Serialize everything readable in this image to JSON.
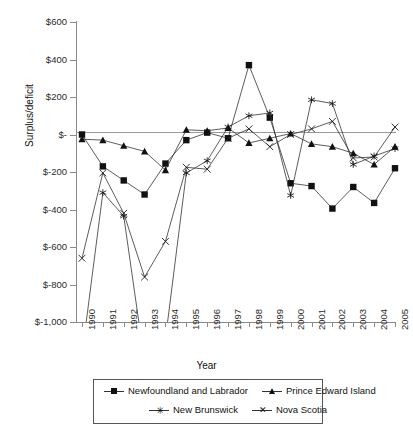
{
  "chart_data": {
    "type": "line",
    "title": "",
    "xlabel": "Year",
    "ylabel": "Surplus/deficit",
    "grid": false,
    "legend_position": "bottom",
    "x": [
      1990,
      1991,
      1992,
      1993,
      1994,
      1995,
      1996,
      1997,
      1998,
      1999,
      2000,
      2001,
      2002,
      2003,
      2004,
      2005
    ],
    "xtick_labels": [
      "1990",
      "1991",
      "1992",
      "1993",
      "1994",
      "1995",
      "1996",
      "1997",
      "1998",
      "1999",
      "2000",
      "2001",
      "2002",
      "2003",
      "2004",
      "2005"
    ],
    "ylim": [
      -1000,
      600
    ],
    "ytick_labels": [
      "$600",
      "$400",
      "$200",
      "$-",
      "$-200",
      "$-400",
      "$-600",
      "$-800",
      "$-1,000"
    ],
    "ytick_values": [
      600,
      400,
      200,
      0,
      -200,
      -400,
      -600,
      -800,
      -1000
    ],
    "series": [
      {
        "name": "Newfoundland and Labrador",
        "marker": "square",
        "values": [
          0,
          -170,
          -245,
          -320,
          -155,
          -30,
          10,
          -20,
          370,
          90,
          -260,
          -275,
          -395,
          -280,
          -365,
          -180
        ]
      },
      {
        "name": "Prince Edward Island",
        "marker": "triangle",
        "values": [
          -25,
          -30,
          -60,
          -90,
          -190,
          25,
          20,
          35,
          -45,
          -20,
          5,
          -50,
          -65,
          -100,
          -160,
          -65
        ]
      },
      {
        "name": "New Brunswick",
        "marker": "asterisk",
        "values": [
          -1175,
          -310,
          -435,
          -1215,
          -1090,
          -205,
          -140,
          40,
          100,
          115,
          -325,
          185,
          165,
          -160,
          -115,
          -75
        ]
      },
      {
        "name": "Nova Scotia",
        "marker": "x",
        "values": [
          -660,
          -205,
          -420,
          -760,
          -570,
          -175,
          -185,
          -20,
          30,
          -65,
          0,
          30,
          70,
          -125,
          -120,
          40
        ]
      }
    ]
  },
  "legend": {
    "entries": [
      {
        "label": "Newfoundland and Labrador",
        "marker": "square"
      },
      {
        "label": "Prince Edward Island",
        "marker": "triangle"
      },
      {
        "label": "New Brunswick",
        "marker": "asterisk"
      },
      {
        "label": "Nova Scotia",
        "marker": "x"
      }
    ]
  }
}
